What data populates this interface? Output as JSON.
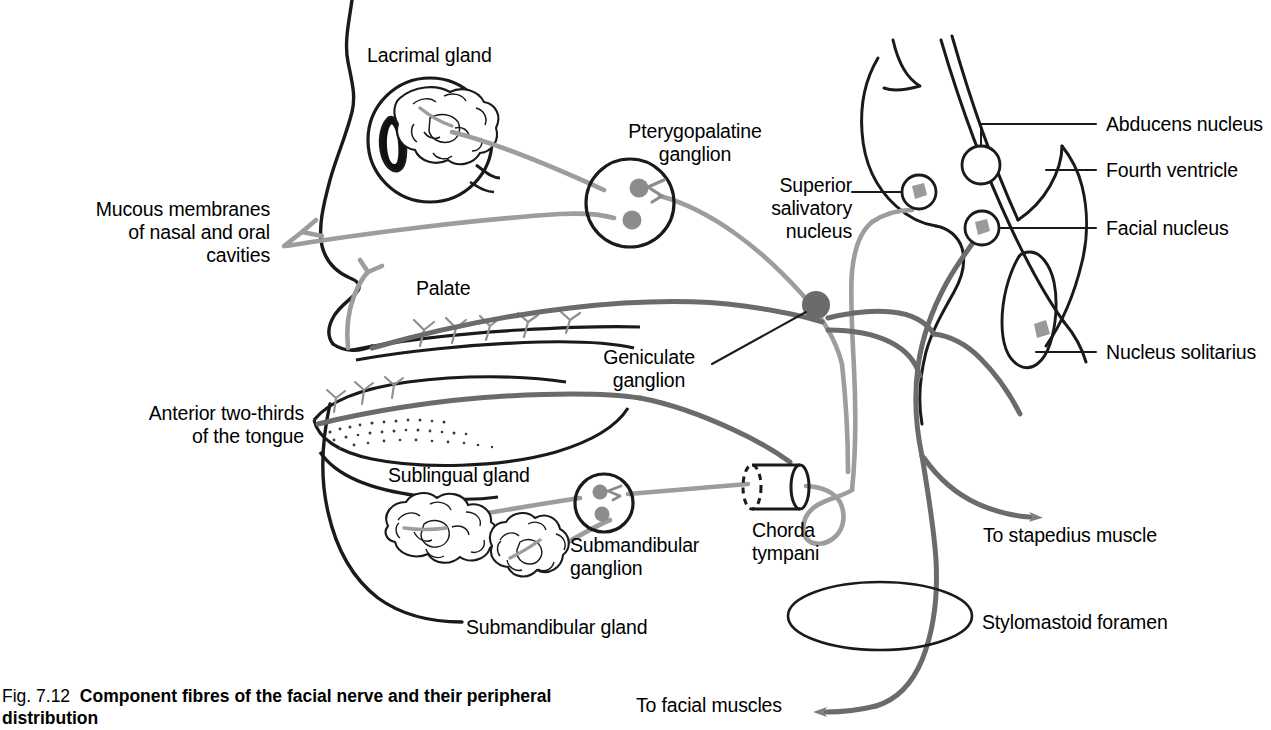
{
  "figure": {
    "number": "Fig. 7.12",
    "caption": "Component fibres of the facial nerve and their peripheral distribution",
    "domain": "anatomy-diagram"
  },
  "colors": {
    "outline": "#1a1a1a",
    "nerve_dark": "#6b6b6b",
    "nerve_light": "#9d9d9d",
    "ganglion_fill": "#8c8c8c",
    "background": "#ffffff"
  },
  "labels": {
    "lacrimal_gland": "Lacrimal gland",
    "pterygopalatine_ganglion": "Pterygopalatine\nganglion",
    "superior_salivatory_nucleus": "Superior\nsalivatory\nnucleus",
    "abducens_nucleus": "Abducens nucleus",
    "fourth_ventricle": "Fourth ventricle",
    "facial_nucleus": "Facial nucleus",
    "nucleus_solitarius": "Nucleus solitarius",
    "mucous_membranes": "Mucous membranes\nof nasal and oral\ncavities",
    "palate": "Palate",
    "geniculate_ganglion": "Geniculate\nganglion",
    "anterior_two_thirds": "Anterior two-thirds\nof the tongue",
    "sublingual_gland": "Sublingual gland",
    "submandibular_ganglion": "Submandibular\nganglion",
    "submandibular_gland": "Submandibular gland",
    "chorda_tympani": "Chorda\ntympani",
    "to_stapedius_muscle": "To stapedius muscle",
    "stylomastoid_foramen": "Stylomastoid foramen",
    "to_facial_muscles": "To facial muscles"
  },
  "structures": [
    {
      "name": "lacrimal-gland",
      "kind": "gland"
    },
    {
      "name": "eyeball",
      "kind": "organ"
    },
    {
      "name": "pterygopalatine-ganglion",
      "kind": "ganglion"
    },
    {
      "name": "geniculate-ganglion",
      "kind": "ganglion"
    },
    {
      "name": "submandibular-ganglion",
      "kind": "ganglion"
    },
    {
      "name": "sublingual-gland",
      "kind": "gland"
    },
    {
      "name": "submandibular-gland",
      "kind": "gland"
    },
    {
      "name": "chorda-tympani",
      "kind": "nerve-segment"
    },
    {
      "name": "stylomastoid-foramen",
      "kind": "foramen"
    },
    {
      "name": "superior-salivatory-nucleus",
      "kind": "nucleus"
    },
    {
      "name": "abducens-nucleus",
      "kind": "nucleus"
    },
    {
      "name": "facial-nucleus",
      "kind": "nucleus"
    },
    {
      "name": "nucleus-solitarius",
      "kind": "nucleus"
    },
    {
      "name": "fourth-ventricle",
      "kind": "ventricle"
    },
    {
      "name": "brainstem",
      "kind": "region"
    },
    {
      "name": "head-profile",
      "kind": "outline"
    },
    {
      "name": "palate",
      "kind": "region"
    },
    {
      "name": "tongue",
      "kind": "organ"
    }
  ]
}
